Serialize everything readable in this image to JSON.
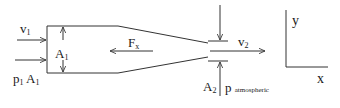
{
  "diagram": {
    "type": "nozzle-control-volume",
    "labels": {
      "v1": {
        "base": "v",
        "sub": "1"
      },
      "A1": {
        "base": "A",
        "sub": "1"
      },
      "p1A1": {
        "p": "p",
        "p_sub": "1",
        "A": "A",
        "A_sub": "1"
      },
      "Fx": {
        "base": "F",
        "sub": "x"
      },
      "v2": {
        "base": "v",
        "sub": "2"
      },
      "A2": {
        "base": "A",
        "sub": "2"
      },
      "p_atm": {
        "base": "p",
        "sub": "atmospheric"
      },
      "axis_y": "y",
      "axis_x": "x"
    },
    "colors": {
      "stroke": "#333333",
      "text": "#1a1a1a",
      "background": "#ffffff"
    }
  }
}
